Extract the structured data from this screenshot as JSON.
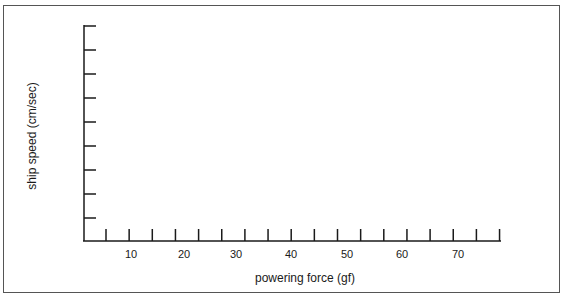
{
  "chart_data": {
    "type": "line",
    "title": "",
    "xlabel": "powering force (gf)",
    "ylabel": "ship speed (cm/sec)",
    "x_tick_labels": [
      "10",
      "20",
      "30",
      "40",
      "50",
      "60",
      "70"
    ],
    "x_tick_count": 18,
    "y_tick_count": 9,
    "y_tick_labels": [],
    "xlim": [
      0,
      80
    ],
    "grid": false,
    "series": [],
    "note": "Blank axes template with no plotted data"
  },
  "labels": {
    "x_ticks": [
      {
        "text": "10",
        "x": 131
      },
      {
        "text": "20",
        "x": 184
      },
      {
        "text": "30",
        "x": 236
      },
      {
        "text": "40",
        "x": 291
      },
      {
        "text": "50",
        "x": 347
      },
      {
        "text": "60",
        "x": 402
      },
      {
        "text": "70",
        "x": 458
      }
    ]
  }
}
